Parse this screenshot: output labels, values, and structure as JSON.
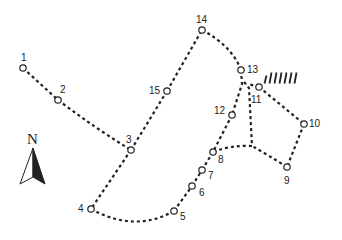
{
  "diagram": {
    "type": "route-map",
    "colors": {
      "line": "#222222",
      "node_fill": "#ffffff",
      "background": "#ffffff"
    },
    "north_arrow": {
      "label": "N",
      "x": 33,
      "y": 138
    },
    "nodes": [
      {
        "id": "1",
        "label": "1",
        "x": 23,
        "y": 68,
        "lx": 21,
        "ly": 53
      },
      {
        "id": "2",
        "label": "2",
        "x": 58,
        "y": 100,
        "lx": 60,
        "ly": 85
      },
      {
        "id": "3",
        "label": "3",
        "x": 131,
        "y": 150,
        "lx": 126,
        "ly": 135
      },
      {
        "id": "4",
        "label": "4",
        "x": 91,
        "y": 209,
        "lx": 78,
        "ly": 204
      },
      {
        "id": "5",
        "label": "5",
        "x": 174,
        "y": 211,
        "lx": 180,
        "ly": 212
      },
      {
        "id": "6",
        "label": "6",
        "x": 192,
        "y": 186,
        "lx": 199,
        "ly": 188
      },
      {
        "id": "7",
        "label": "7",
        "x": 202,
        "y": 170,
        "lx": 208,
        "ly": 171
      },
      {
        "id": "8",
        "label": "8",
        "x": 213,
        "y": 152,
        "lx": 218,
        "ly": 155
      },
      {
        "id": "9",
        "label": "9",
        "x": 287,
        "y": 167,
        "lx": 284,
        "ly": 176
      },
      {
        "id": "10",
        "label": "10",
        "x": 304,
        "y": 124,
        "lx": 309,
        "ly": 119
      },
      {
        "id": "11",
        "label": "11",
        "x": 259,
        "y": 87,
        "lx": 251,
        "ly": 95
      },
      {
        "id": "12",
        "label": "12",
        "x": 232,
        "y": 115,
        "lx": 214,
        "ly": 106
      },
      {
        "id": "13",
        "label": "13",
        "x": 241,
        "y": 70,
        "lx": 247,
        "ly": 65
      },
      {
        "id": "14",
        "label": "14",
        "x": 202,
        "y": 30,
        "lx": 196,
        "ly": 15
      },
      {
        "id": "15",
        "label": "15",
        "x": 167,
        "y": 91,
        "lx": 149,
        "ly": 86
      }
    ],
    "paths": [
      {
        "from": "1",
        "to": "2",
        "d": "M23,68 L58,100"
      },
      {
        "from": "2",
        "to": "3",
        "d": "M58,100 Q95,128 131,150"
      },
      {
        "from": "3",
        "to": "15",
        "d": "M131,150 L167,91"
      },
      {
        "from": "15",
        "to": "14",
        "d": "M167,91 L202,30"
      },
      {
        "from": "14",
        "to": "13",
        "d": "M202,30 Q232,46 241,70"
      },
      {
        "from": "13",
        "to": "12",
        "d": "M241,70 L242,84 L232,115"
      },
      {
        "from": "12",
        "to": "8",
        "d": "M232,115 L213,152"
      },
      {
        "from": "13",
        "to": "junction",
        "d": "M244,82 L249,88 L252,146"
      },
      {
        "from": "11",
        "to": "10",
        "d": "M259,87 L304,124"
      },
      {
        "from": "11",
        "to": "13",
        "d": "M259,87 L248,84"
      },
      {
        "from": "10",
        "to": "9",
        "d": "M304,124 L287,167"
      },
      {
        "from": "9",
        "to": "junction",
        "d": "M287,167 Q268,155 252,146"
      },
      {
        "from": "junction",
        "to": "8",
        "d": "M252,146 Q230,145 213,152"
      },
      {
        "from": "3",
        "to": "4",
        "d": "M131,150 L91,209"
      },
      {
        "from": "4",
        "to": "5",
        "d": "M91,209 Q135,233 174,211"
      },
      {
        "from": "5",
        "to": "6",
        "d": "M174,211 L192,186"
      },
      {
        "from": "6",
        "to": "7",
        "d": "M192,186 L202,170"
      },
      {
        "from": "7",
        "to": "8",
        "d": "M202,170 L213,152"
      }
    ],
    "hatch_mark": {
      "near": "11",
      "x1": 265,
      "y1": 78,
      "count": 7,
      "spacing": 5,
      "length": 11
    }
  }
}
